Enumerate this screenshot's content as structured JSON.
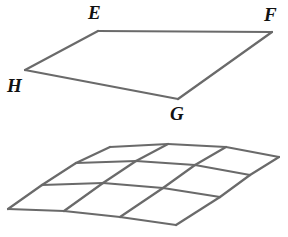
{
  "figure": {
    "background_color": "#ffffff",
    "stroke_color": "#6a6a6a",
    "label_color": "#111111",
    "stroke_width": 2.2,
    "quadrilateral": {
      "name": "EFGH",
      "vertices": [
        {
          "label": "E",
          "x": 98,
          "y": 31,
          "label_x": 88,
          "label_y": 3
        },
        {
          "label": "F",
          "x": 272,
          "y": 32,
          "label_x": 264,
          "label_y": 5
        },
        {
          "label": "G",
          "x": 178,
          "y": 99,
          "label_x": 170,
          "label_y": 104
        },
        {
          "label": "H",
          "x": 25,
          "y": 70,
          "label_x": 7,
          "label_y": 76
        }
      ],
      "edges": [
        {
          "from": "E",
          "to": "F"
        },
        {
          "from": "F",
          "to": "G"
        },
        {
          "from": "G",
          "to": "H"
        },
        {
          "from": "H",
          "to": "E"
        }
      ]
    },
    "grid": {
      "description": "warped 3 by 3 mesh representing a plane",
      "rows": 3,
      "columns": 3,
      "corner_points": {
        "top": {
          "x": 110,
          "y": 146
        },
        "right": {
          "x": 279,
          "y": 158
        },
        "bottom": {
          "x": 176,
          "y": 225
        },
        "left": {
          "x": 8,
          "y": 209
        }
      },
      "node_rows": [
        [
          {
            "x": 110,
            "y": 147
          },
          {
            "x": 168,
            "y": 144
          },
          {
            "x": 226,
            "y": 147
          },
          {
            "x": 279,
            "y": 157
          }
        ],
        [
          {
            "x": 76,
            "y": 163
          },
          {
            "x": 136,
            "y": 161
          },
          {
            "x": 195,
            "y": 165
          },
          {
            "x": 250,
            "y": 175
          }
        ],
        [
          {
            "x": 42,
            "y": 185
          },
          {
            "x": 103,
            "y": 183
          },
          {
            "x": 163,
            "y": 188
          },
          {
            "x": 220,
            "y": 197
          }
        ],
        [
          {
            "x": 8,
            "y": 209
          },
          {
            "x": 64,
            "y": 211
          },
          {
            "x": 120,
            "y": 217
          },
          {
            "x": 176,
            "y": 225
          }
        ]
      ]
    }
  }
}
